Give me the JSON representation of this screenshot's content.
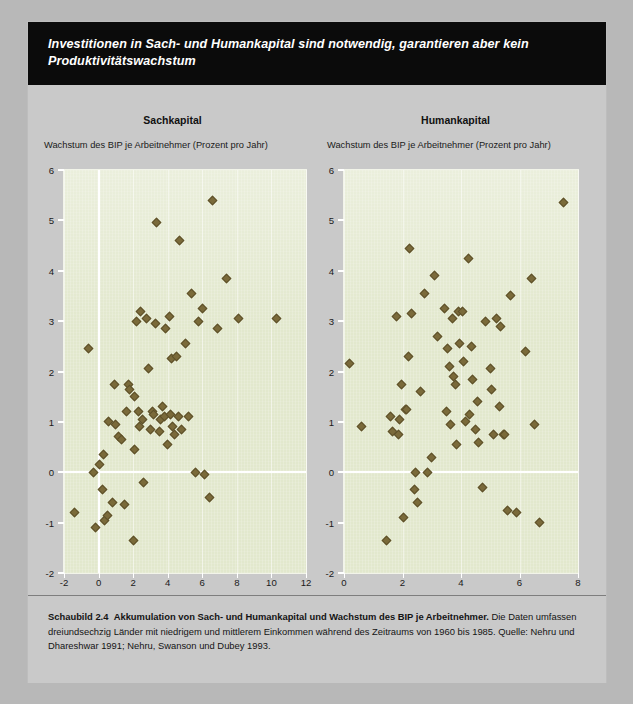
{
  "banner": {
    "headline": "Investitionen in Sach- und Humankapital sind notwendig, garantieren aber kein Produktivitätswachstum"
  },
  "caption": {
    "figure_label": "Schaubild 2.4",
    "figure_title": "Akkumulation von Sach- und Humankapital und Wachstum des BIP je Arbeitnehmer.",
    "body": "Die Daten umfassen dreiundsechzig Länder mit niedrigem und mittlerem Einkommen während des Zeitraums von 1960 bis 1985.",
    "source": "Quelle: Nehru und Dhareshwar 1991; Nehru, Swanson und Dubey 1993."
  },
  "colors": {
    "page_background": "#c9c9c9",
    "banner_background": "#0b0b0b",
    "banner_text": "#ffffff",
    "plot_background": "#e2e8cd",
    "marker_fill": "#7a6a3a",
    "marker_stroke": "#5d5029",
    "gridline": "#ffffff"
  },
  "chart_data": [
    {
      "type": "scatter",
      "title": "Sachkapital",
      "ylabel": "Wachstum des BIP je Arbeitnehmer (Prozent pro Jahr)",
      "xlabel": "Wachstum des Sachkapitals je Arbeitnehmer (Prozent)",
      "xlim": [
        -2,
        12
      ],
      "ylim": [
        -2,
        6
      ],
      "xticks": [
        -2,
        0,
        2,
        4,
        6,
        8,
        10,
        12
      ],
      "yticks": [
        -2,
        -1,
        0,
        1,
        2,
        3,
        4,
        5,
        6
      ],
      "xtick_labels": [
        "-2",
        "0",
        "2",
        "4",
        "6",
        "8",
        "10",
        "12"
      ],
      "ytick_labels": [
        "-2",
        "-1",
        "0",
        "1",
        "2",
        "3",
        "4",
        "5",
        "6"
      ],
      "grid": false,
      "zero_lines": {
        "x": 0,
        "y": 0
      },
      "points": [
        [
          -1.4,
          -0.8
        ],
        [
          -0.6,
          2.45
        ],
        [
          -0.3,
          0.0
        ],
        [
          -0.15,
          -1.1
        ],
        [
          0.2,
          -0.35
        ],
        [
          0.3,
          0.35
        ],
        [
          0.05,
          0.15
        ],
        [
          0.35,
          -0.95
        ],
        [
          0.5,
          -0.85
        ],
        [
          0.8,
          -0.6
        ],
        [
          0.6,
          1.0
        ],
        [
          0.9,
          1.75
        ],
        [
          1.0,
          0.95
        ],
        [
          1.15,
          0.7
        ],
        [
          1.35,
          0.65
        ],
        [
          1.5,
          -0.65
        ],
        [
          1.6,
          1.2
        ],
        [
          1.75,
          1.75
        ],
        [
          1.8,
          1.65
        ],
        [
          2.0,
          -1.35
        ],
        [
          2.05,
          0.45
        ],
        [
          2.1,
          1.5
        ],
        [
          2.2,
          3.0
        ],
        [
          2.3,
          1.2
        ],
        [
          2.35,
          0.9
        ],
        [
          2.45,
          3.2
        ],
        [
          2.55,
          1.05
        ],
        [
          2.6,
          -0.2
        ],
        [
          2.8,
          3.05
        ],
        [
          2.9,
          2.05
        ],
        [
          3.0,
          0.85
        ],
        [
          3.1,
          1.2
        ],
        [
          3.2,
          1.15
        ],
        [
          3.3,
          2.95
        ],
        [
          3.35,
          4.95
        ],
        [
          3.5,
          0.8
        ],
        [
          3.6,
          1.05
        ],
        [
          3.7,
          1.3
        ],
        [
          3.8,
          1.1
        ],
        [
          3.9,
          2.85
        ],
        [
          4.0,
          0.55
        ],
        [
          4.1,
          3.1
        ],
        [
          4.15,
          1.15
        ],
        [
          4.2,
          2.25
        ],
        [
          4.3,
          0.9
        ],
        [
          4.4,
          0.75
        ],
        [
          4.5,
          2.3
        ],
        [
          4.6,
          1.1
        ],
        [
          4.7,
          4.6
        ],
        [
          4.8,
          0.85
        ],
        [
          5.0,
          2.55
        ],
        [
          5.2,
          1.1
        ],
        [
          5.4,
          3.55
        ],
        [
          5.6,
          0.0
        ],
        [
          5.8,
          3.0
        ],
        [
          6.0,
          3.25
        ],
        [
          6.1,
          -0.05
        ],
        [
          6.4,
          -0.5
        ],
        [
          6.6,
          5.4
        ],
        [
          6.9,
          2.85
        ],
        [
          7.4,
          3.85
        ],
        [
          8.1,
          3.05
        ],
        [
          10.3,
          3.05
        ]
      ]
    },
    {
      "type": "scatter",
      "title": "Humankapital",
      "ylabel": "Wachstum des BIP je Arbeitnehmer (Prozent pro Jahr)",
      "xlabel": "Zunahme der Schuljahre je Arbeitnehmer",
      "xlim": [
        0,
        8
      ],
      "ylim": [
        -2,
        6
      ],
      "xticks": [
        0,
        2,
        4,
        6,
        8
      ],
      "yticks": [
        -2,
        -1,
        0,
        1,
        2,
        3,
        4,
        5,
        6
      ],
      "xtick_labels": [
        "0",
        "2",
        "4",
        "6",
        "8"
      ],
      "ytick_labels": [
        "-2",
        "-1",
        "0",
        "1",
        "2",
        "3",
        "4",
        "5",
        "6"
      ],
      "grid": false,
      "zero_lines": {
        "y": 0
      },
      "points": [
        [
          0.2,
          2.15
        ],
        [
          0.6,
          0.9
        ],
        [
          1.45,
          -1.35
        ],
        [
          1.6,
          1.1
        ],
        [
          1.65,
          0.8
        ],
        [
          1.8,
          3.1
        ],
        [
          1.85,
          0.75
        ],
        [
          1.9,
          1.05
        ],
        [
          1.95,
          1.75
        ],
        [
          2.05,
          -0.9
        ],
        [
          2.1,
          1.25
        ],
        [
          2.15,
          1.25
        ],
        [
          2.2,
          2.3
        ],
        [
          2.25,
          4.45
        ],
        [
          2.3,
          3.15
        ],
        [
          2.4,
          -0.35
        ],
        [
          2.45,
          0.0
        ],
        [
          2.5,
          -0.6
        ],
        [
          2.6,
          1.6
        ],
        [
          2.75,
          3.55
        ],
        [
          2.85,
          0.0
        ],
        [
          3.0,
          0.3
        ],
        [
          3.1,
          3.9
        ],
        [
          3.2,
          2.7
        ],
        [
          3.45,
          3.25
        ],
        [
          3.5,
          1.2
        ],
        [
          3.55,
          2.45
        ],
        [
          3.6,
          2.1
        ],
        [
          3.65,
          0.95
        ],
        [
          3.7,
          3.05
        ],
        [
          3.75,
          1.9
        ],
        [
          3.8,
          1.75
        ],
        [
          3.85,
          0.55
        ],
        [
          3.9,
          3.2
        ],
        [
          3.95,
          2.55
        ],
        [
          4.05,
          3.2
        ],
        [
          4.1,
          2.2
        ],
        [
          4.15,
          1.0
        ],
        [
          4.25,
          4.25
        ],
        [
          4.3,
          1.15
        ],
        [
          4.35,
          2.5
        ],
        [
          4.4,
          1.85
        ],
        [
          4.5,
          0.85
        ],
        [
          4.55,
          1.4
        ],
        [
          4.6,
          0.6
        ],
        [
          4.75,
          -0.3
        ],
        [
          4.85,
          3.0
        ],
        [
          5.0,
          2.05
        ],
        [
          5.05,
          1.65
        ],
        [
          5.1,
          0.75
        ],
        [
          5.2,
          3.05
        ],
        [
          5.3,
          1.3
        ],
        [
          5.35,
          2.9
        ],
        [
          5.45,
          0.75
        ],
        [
          5.5,
          0.75
        ],
        [
          5.6,
          -0.75
        ],
        [
          5.7,
          3.5
        ],
        [
          5.9,
          -0.8
        ],
        [
          6.2,
          2.4
        ],
        [
          6.4,
          3.85
        ],
        [
          6.5,
          0.95
        ],
        [
          6.7,
          -1.0
        ],
        [
          7.5,
          5.35
        ]
      ]
    }
  ]
}
